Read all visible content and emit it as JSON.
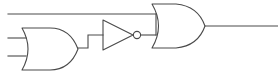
{
  "diagram": {
    "type": "digital-logic-schematic",
    "canvas": {
      "width": 278,
      "height": 77,
      "background": "#ffffff"
    },
    "style": {
      "stroke_color": "#4a4a4a",
      "stroke_width": 1.1,
      "fill": "none"
    }
  },
  "components": {
    "or_gate_1": {
      "label": "OR",
      "symbol": "or-gate",
      "x": 22,
      "y": 28,
      "width": 56,
      "height": 42,
      "path": "M 22 28 Q 34 49 22 70 L 50 70 Q 70 70 78 49 Q 70 28 50 28 Z"
    },
    "not_gate": {
      "label": "NOT",
      "symbol": "not-gate-inverter",
      "x": 103,
      "y": 20,
      "width": 30,
      "height": 30,
      "path": "M 103 20 L 103 50 L 133 35 Z",
      "bubble": {
        "cx": 137,
        "cy": 35,
        "r": 3.6
      }
    },
    "or_gate_2": {
      "label": "OR",
      "symbol": "or-gate",
      "x": 152,
      "y": 4,
      "width": 53,
      "height": 44,
      "path": "M 152 4 Q 165 26 152 48 L 176 48 Q 198 46 205 26 Q 198 6 176 4 Z"
    }
  },
  "wires": {
    "input_top": {
      "name": "top-input-wire",
      "path": "M 8 14 L 156 14"
    },
    "input_a": {
      "name": "input-a-wire",
      "path": "M 8 38 L 26 38"
    },
    "input_b": {
      "name": "input-b-wire",
      "path": "M 8 56 L 26 56"
    },
    "or1_to_not": {
      "name": "or1-to-inverter-wire",
      "path": "M 78 48 L 88 48 L 88 35 L 103 35"
    },
    "not_to_or2": {
      "name": "inverter-to-or2-wire",
      "path": "M 140.6 35 L 156 35"
    },
    "top_down_to_or2": {
      "name": "top-branch-vertical-wire",
      "path": "M 156 14 L 156 35"
    },
    "output": {
      "name": "output-wire",
      "path": "M 205 26 L 278 26"
    }
  }
}
